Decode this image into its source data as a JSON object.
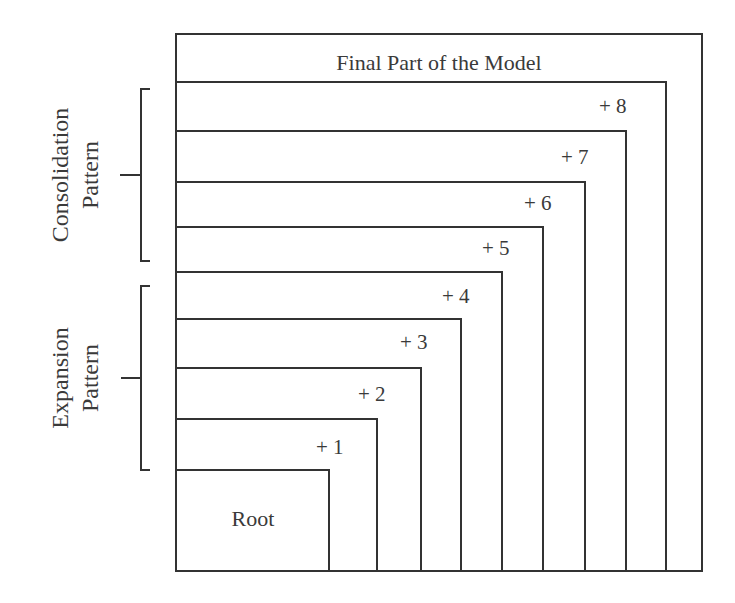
{
  "diagram": {
    "title": "Final Part of the Model",
    "root_label": "Root",
    "line_color": "#333333",
    "layers": [
      {
        "label": "+ 1"
      },
      {
        "label": "+ 2"
      },
      {
        "label": "+ 3"
      },
      {
        "label": "+ 4"
      },
      {
        "label": "+ 5"
      },
      {
        "label": "+ 6"
      },
      {
        "label": "+ 7"
      },
      {
        "label": "+ 8"
      }
    ],
    "brackets": {
      "consolidation": {
        "line1": "Consolidation",
        "line2": "Pattern"
      },
      "expansion": {
        "line1": "Expansion",
        "line2": "Pattern"
      }
    }
  }
}
